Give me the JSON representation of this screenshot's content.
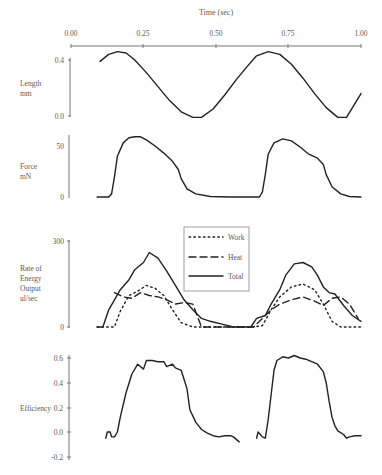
{
  "chart_data": [
    {
      "type": "line",
      "panel": "time-axis",
      "xlabel": "Time (sec)",
      "xlim": [
        0.0,
        1.0
      ],
      "xticks": [
        "0.00",
        "0.25",
        "0.50",
        "0.75",
        "1.00"
      ]
    },
    {
      "type": "line",
      "panel": "length",
      "ylabel": "Length\nmm",
      "ylabel_lines": [
        "Length",
        "mm"
      ],
      "ylim": [
        0.0,
        0.4
      ],
      "yticks": [
        "0.4",
        "0.0"
      ],
      "series": [
        {
          "name": "Length",
          "style": "solid",
          "x": [
            0.1,
            0.13,
            0.16,
            0.19,
            0.22,
            0.26,
            0.3,
            0.34,
            0.38,
            0.42,
            0.45,
            0.49,
            0.53,
            0.57,
            0.61,
            0.64,
            0.68,
            0.72,
            0.76,
            0.8,
            0.84,
            0.88,
            0.92,
            0.95,
            1.0
          ],
          "y": [
            0.39,
            0.44,
            0.46,
            0.45,
            0.4,
            0.31,
            0.21,
            0.11,
            0.03,
            -0.01,
            -0.01,
            0.05,
            0.15,
            0.26,
            0.36,
            0.43,
            0.46,
            0.44,
            0.37,
            0.27,
            0.16,
            0.06,
            -0.01,
            -0.01,
            0.16
          ]
        }
      ]
    },
    {
      "type": "line",
      "panel": "force",
      "ylabel": "Force\nmN",
      "ylabel_lines": [
        "Force",
        "mN"
      ],
      "ylim": [
        0,
        50
      ],
      "yticks": [
        "50",
        "0"
      ],
      "series": [
        {
          "name": "Force",
          "style": "solid",
          "x": [
            0.09,
            0.13,
            0.14,
            0.15,
            0.16,
            0.18,
            0.2,
            0.22,
            0.24,
            0.26,
            0.29,
            0.32,
            0.35,
            0.37,
            0.38,
            0.4,
            0.43,
            0.48,
            0.55,
            0.62,
            0.65,
            0.66,
            0.67,
            0.68,
            0.7,
            0.73,
            0.76,
            0.79,
            0.82,
            0.85,
            0.87,
            0.88,
            0.9,
            0.93,
            0.96,
            1.0
          ],
          "y": [
            0,
            0,
            3,
            20,
            40,
            53,
            58,
            59,
            59,
            56,
            50,
            43,
            35,
            27,
            18,
            8,
            3,
            0.5,
            0,
            0,
            0,
            5,
            22,
            42,
            53,
            57,
            55,
            49,
            42,
            38,
            32,
            22,
            10,
            3,
            0.5,
            0
          ]
        }
      ]
    },
    {
      "type": "line",
      "panel": "energy",
      "ylabel": "Rate of\nEnergy\nOutput\nul/sec",
      "ylabel_lines": [
        "Rate of",
        "Energy",
        "Output",
        "ul/sec"
      ],
      "ylim": [
        0,
        300
      ],
      "yticks": [
        "300",
        "0"
      ],
      "legend": {
        "position": "upper center",
        "entries": [
          "Work",
          "Heat",
          "Total"
        ]
      },
      "series": [
        {
          "name": "Work",
          "style": "dotted",
          "x": [
            0.09,
            0.12,
            0.15,
            0.17,
            0.2,
            0.23,
            0.26,
            0.29,
            0.32,
            0.35,
            0.38,
            0.42,
            0.5,
            0.58,
            0.63,
            0.66,
            0.69,
            0.72,
            0.76,
            0.8,
            0.84,
            0.87,
            0.9,
            0.93,
            0.97,
            1.0
          ],
          "y": [
            0,
            0,
            0,
            55,
            110,
            125,
            145,
            135,
            110,
            60,
            15,
            0,
            0,
            0,
            0,
            5,
            60,
            105,
            140,
            150,
            130,
            80,
            20,
            0,
            0,
            0
          ]
        },
        {
          "name": "Heat",
          "style": "dashed",
          "x": [
            0.15,
            0.18,
            0.21,
            0.24,
            0.27,
            0.3,
            0.33,
            0.36,
            0.39,
            0.42,
            0.45,
            0.63,
            0.66,
            0.69,
            0.72,
            0.76,
            0.8,
            0.84,
            0.87,
            0.9,
            0.93,
            0.96,
            0.99
          ],
          "y": [
            120,
            105,
            100,
            120,
            110,
            105,
            95,
            80,
            85,
            80,
            0,
            0,
            30,
            60,
            80,
            95,
            105,
            90,
            75,
            100,
            105,
            80,
            30
          ]
        },
        {
          "name": "Total",
          "style": "solid",
          "x": [
            0.09,
            0.11,
            0.13,
            0.15,
            0.17,
            0.2,
            0.22,
            0.25,
            0.27,
            0.3,
            0.33,
            0.36,
            0.39,
            0.42,
            0.45,
            0.48,
            0.52,
            0.56,
            0.6,
            0.62,
            0.64,
            0.67,
            0.69,
            0.72,
            0.74,
            0.77,
            0.8,
            0.83,
            0.85,
            0.87,
            0.89,
            0.91,
            0.94,
            0.97,
            1.0
          ],
          "y": [
            0,
            0,
            60,
            95,
            130,
            165,
            200,
            225,
            260,
            240,
            195,
            145,
            95,
            60,
            30,
            20,
            10,
            0,
            0,
            0,
            30,
            40,
            80,
            130,
            180,
            220,
            225,
            210,
            180,
            140,
            120,
            115,
            75,
            40,
            20
          ]
        }
      ]
    },
    {
      "type": "line",
      "panel": "efficiency",
      "ylabel": "Efficiency",
      "ylabel_lines": [
        "Efficiency"
      ],
      "ylim": [
        -0.2,
        0.6
      ],
      "yticks": [
        "0.6",
        "0.4",
        "0.2",
        "0.0",
        "-0.2"
      ],
      "series": [
        {
          "name": "Efficiency cycle 1",
          "style": "solid",
          "x": [
            0.12,
            0.125,
            0.135,
            0.14,
            0.15,
            0.16,
            0.17,
            0.19,
            0.21,
            0.23,
            0.25,
            0.26,
            0.28,
            0.3,
            0.32,
            0.33,
            0.35,
            0.36,
            0.38,
            0.4,
            0.41,
            0.43,
            0.45,
            0.47,
            0.49,
            0.51,
            0.53,
            0.55,
            0.56,
            0.58
          ],
          "y": [
            -0.05,
            0.0,
            0.0,
            -0.04,
            -0.04,
            0.0,
            0.12,
            0.32,
            0.47,
            0.55,
            0.51,
            0.58,
            0.58,
            0.57,
            0.57,
            0.53,
            0.55,
            0.52,
            0.5,
            0.35,
            0.18,
            0.08,
            0.02,
            -0.01,
            -0.03,
            -0.04,
            -0.03,
            -0.03,
            -0.04,
            -0.08
          ]
        },
        {
          "name": "Efficiency cycle 2",
          "style": "solid",
          "x": [
            0.64,
            0.645,
            0.66,
            0.67,
            0.68,
            0.69,
            0.7,
            0.71,
            0.73,
            0.75,
            0.77,
            0.79,
            0.81,
            0.83,
            0.85,
            0.87,
            0.88,
            0.89,
            0.9,
            0.91,
            0.92,
            0.94,
            0.95,
            0.96,
            0.98,
            1.0
          ],
          "y": [
            -0.05,
            0.0,
            -0.04,
            -0.05,
            0.1,
            0.3,
            0.5,
            0.58,
            0.61,
            0.6,
            0.62,
            0.6,
            0.59,
            0.57,
            0.55,
            0.49,
            0.4,
            0.25,
            0.12,
            0.05,
            0.01,
            -0.02,
            -0.05,
            -0.04,
            -0.03,
            -0.03
          ]
        }
      ]
    }
  ],
  "labels": {
    "time_axis_title": "Time (sec)",
    "x_ticks": [
      "0.00",
      "0.25",
      "0.50",
      "0.75",
      "1.00"
    ],
    "length": {
      "title_1": "Length",
      "title_2": "mm",
      "ticks": [
        "0.4",
        "0.0"
      ]
    },
    "force": {
      "title_1": "Force",
      "title_2": "mN",
      "ticks": [
        "50",
        "0"
      ]
    },
    "energy": {
      "title_1": "Rate of",
      "title_2": "Energy",
      "title_3": "Output",
      "title_4": "ul/sec",
      "ticks": [
        "300",
        "0"
      ]
    },
    "efficiency": {
      "title": "Efficiency",
      "ticks": [
        "0.6",
        "0.4",
        "0.2",
        "0.0",
        "-0.2"
      ]
    },
    "legend": {
      "work": "Work",
      "heat": "Heat",
      "total": "Total"
    }
  },
  "colors": {
    "line": "#222222",
    "axis": "#777777",
    "text": "#5a5a5a",
    "background": "#ffffff"
  }
}
